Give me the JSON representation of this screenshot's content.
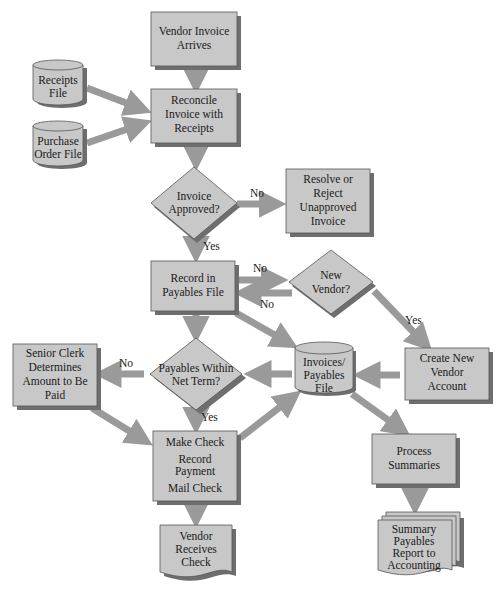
{
  "diagram": {
    "colors": {
      "node_fill": "#c8c8c8",
      "shadow": "#6e6e6e",
      "arrow": "#9a9a9a",
      "border": "#555555"
    },
    "nodes": {
      "vendor_invoice": {
        "lines": [
          "Vendor Invoice",
          "Arrives"
        ]
      },
      "receipts_file": {
        "lines": [
          "Receipts",
          "File"
        ]
      },
      "po_file": {
        "lines": [
          "Purchase",
          "Order File"
        ]
      },
      "reconcile": {
        "lines": [
          "Reconcile",
          "Invoice with",
          "Receipts"
        ]
      },
      "approved": {
        "lines": [
          "Invoice",
          "Approved?"
        ]
      },
      "resolve": {
        "lines": [
          "Resolve or",
          "Reject",
          "Unapproved",
          "Invoice"
        ]
      },
      "record": {
        "lines": [
          "Record in",
          "Payables File"
        ]
      },
      "new_vendor": {
        "lines": [
          "New",
          "Vendor?"
        ]
      },
      "create_vendor": {
        "lines": [
          "Create New",
          "Vendor",
          "Account"
        ]
      },
      "invoices_file": {
        "lines": [
          "Invoices/",
          "Payables",
          "File"
        ]
      },
      "within_term": {
        "lines": [
          "Payables Within",
          "Net Term?"
        ]
      },
      "senior_clerk": {
        "lines": [
          "Senior Clerk",
          "Determines",
          "Amount to Be",
          "Paid"
        ]
      },
      "make_check": {
        "lines": [
          "Make Check",
          "Record",
          "Payment",
          "Mail Check"
        ]
      },
      "vendor_receives": {
        "lines": [
          "Vendor",
          "Receives",
          "Check"
        ]
      },
      "process_summaries": {
        "lines": [
          "Process",
          "Summaries"
        ]
      },
      "summary_report": {
        "lines": [
          "Summary",
          "Payables",
          "Report to",
          "Accounting"
        ]
      }
    },
    "edge_labels": {
      "approved_no": "No",
      "approved_yes": "Yes",
      "record_to_vendor_no": "No",
      "vendor_to_record_no": "No",
      "new_vendor_yes": "Yes",
      "within_term_no": "No",
      "within_term_yes": "Yes"
    }
  }
}
